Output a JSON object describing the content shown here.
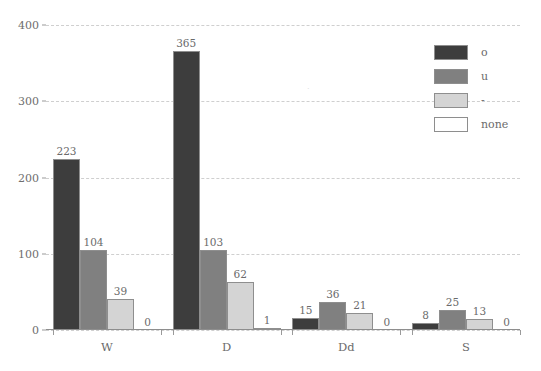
{
  "chart_data": {
    "type": "bar",
    "title": "",
    "subtitle": "",
    "xlabel": "",
    "ylabel": "",
    "categories": [
      "W",
      "D",
      "Dd",
      "S"
    ],
    "series": [
      {
        "name": "o",
        "color": "#3d3d3d",
        "values": [
          223,
          365,
          15,
          8
        ]
      },
      {
        "name": "u",
        "color": "#808080",
        "values": [
          104,
          103,
          36,
          25
        ]
      },
      {
        "name": "-",
        "color": "#d4d4d4",
        "values": [
          39,
          62,
          21,
          13
        ]
      },
      {
        "name": "none",
        "color": "#ffffff",
        "values": [
          0,
          1,
          0,
          0
        ]
      }
    ],
    "ylim": [
      0,
      400
    ],
    "yticks": [
      0,
      100,
      200,
      300,
      400
    ],
    "ytick_labels": [
      "0",
      "100",
      "200",
      "300",
      "400"
    ],
    "grid": true,
    "grid_axis": "y",
    "grid_style": "dashed",
    "grid_color": "#cfcfcf",
    "legend_position": "top-right",
    "show_value_labels": true,
    "bar_edge_color": "#8e8e8e",
    "axis_color": "#8e8e8e",
    "text_color": "#6b6b6b",
    "background": "#ffffff"
  },
  "legend": {
    "entries": [
      {
        "label": "o"
      },
      {
        "label": "u"
      },
      {
        "label": "-"
      },
      {
        "label": "none"
      }
    ]
  },
  "artifact": {
    "glyph": "."
  }
}
